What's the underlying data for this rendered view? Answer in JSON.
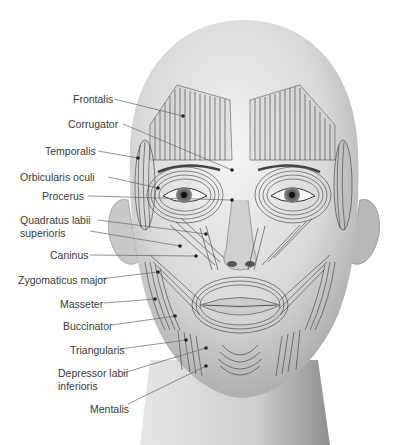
{
  "diagram": {
    "labels": [
      {
        "id": "frontalis",
        "text": "Frontalis",
        "x": 73,
        "y": 93,
        "target": [
          183,
          116
        ]
      },
      {
        "id": "corrugator",
        "text": "Corrugator",
        "x": 68,
        "y": 118,
        "target": [
          232,
          170
        ]
      },
      {
        "id": "temporalis",
        "text": "Temporalis",
        "x": 45,
        "y": 145,
        "target": [
          138,
          158
        ]
      },
      {
        "id": "orbicularis-oculi",
        "text": "Orbicularis oculi",
        "x": 20,
        "y": 171,
        "target": [
          158,
          188
        ]
      },
      {
        "id": "procerus",
        "text": "Procerus",
        "x": 42,
        "y": 190,
        "target": [
          232,
          200
        ]
      },
      {
        "id": "quadratus-labii-superioris",
        "text": "Quadratus labii",
        "text2": "superioris",
        "x": 20,
        "y": 214,
        "target": [
          206,
          234
        ]
      },
      {
        "id": "caninus",
        "text": "Caninus",
        "x": 50,
        "y": 249,
        "target": [
          196,
          256
        ]
      },
      {
        "id": "zygomaticus-major",
        "text": "Zygomaticus major",
        "x": 18,
        "y": 274,
        "target": [
          158,
          272
        ]
      },
      {
        "id": "masseter",
        "text": "Masseter",
        "x": 60,
        "y": 298,
        "target": [
          155,
          299
        ]
      },
      {
        "id": "buccinator",
        "text": "Buccinator",
        "x": 63,
        "y": 320,
        "target": [
          175,
          316
        ]
      },
      {
        "id": "triangularis",
        "text": "Triangularis",
        "x": 70,
        "y": 344,
        "target": [
          186,
          340
        ]
      },
      {
        "id": "depressor-labii-inferioris",
        "text": "Depressor labii",
        "text2": "inferioris",
        "x": 58,
        "y": 367,
        "target": [
          206,
          348
        ]
      },
      {
        "id": "mentalis",
        "text": "Mentalis",
        "x": 90,
        "y": 403,
        "target": [
          206,
          366
        ]
      }
    ]
  }
}
